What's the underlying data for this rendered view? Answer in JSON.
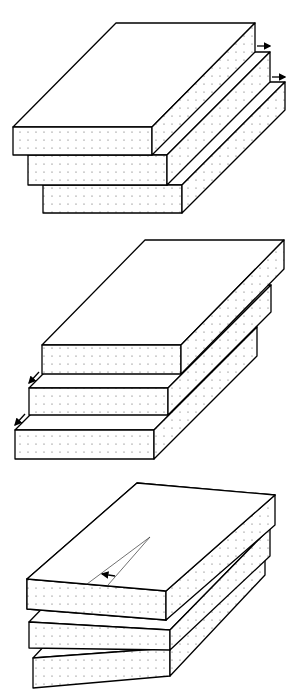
{
  "figure": {
    "background": "#ffffff",
    "line_color": "#000000",
    "panels": [
      {
        "id": "panel-1",
        "label": "layers sliding toward back-right",
        "layers": 3,
        "arrows": [
          "slip arrow upper",
          "slip arrow lower"
        ],
        "arrow_direction": "right"
      },
      {
        "id": "panel-2",
        "label": "layers sliding toward front-left",
        "layers": 3,
        "arrows": [
          "slip arrow upper",
          "slip arrow lower"
        ],
        "arrow_direction": "down-left"
      },
      {
        "id": "panel-3",
        "label": "layers rotated relative to each other",
        "layers": 3,
        "arrows": [
          "rotation angle arrow"
        ],
        "arrow_direction": "rotation"
      }
    ]
  }
}
